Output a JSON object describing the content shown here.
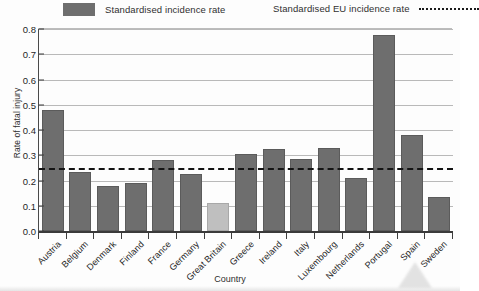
{
  "chart_data": {
    "type": "bar",
    "title": "",
    "xlabel": "Country",
    "ylabel": "Rate of fatal injury",
    "ylim": [
      0.0,
      0.8
    ],
    "ytick_labels": [
      "0.8",
      "0.7",
      "0.6",
      "0.5",
      "0.4",
      "0.3",
      "0.2",
      "0.1",
      "0.0"
    ],
    "ytick_values": [
      0.8,
      0.7,
      0.6,
      0.5,
      0.4,
      0.3,
      0.2,
      0.1,
      0.0
    ],
    "grid": "horizontal",
    "legend_position": "top",
    "categories": [
      "Austria",
      "Belgium",
      "Denmark",
      "Finland",
      "France",
      "Germany",
      "Great Britain",
      "Greece",
      "Ireland",
      "Italy",
      "Luxembourg",
      "Netherlands",
      "Portugal",
      "Spain",
      "Sweden"
    ],
    "values": [
      0.48,
      0.235,
      0.18,
      0.19,
      0.28,
      0.225,
      0.11,
      0.305,
      0.325,
      0.285,
      0.33,
      0.21,
      0.775,
      0.38,
      0.135
    ],
    "highlighted_category": "Great Britain",
    "reference_line": {
      "label": "Standardised EU incidence rate",
      "value": 0.25,
      "style": "dashed"
    },
    "series_label": "Standardised incidence rate",
    "colors": {
      "bar": "#6e6e6e",
      "bar_highlight": "#bfbfbf",
      "reference_line": "#141414",
      "gridline": "#b9b9b9",
      "axis": "#3a3a3a",
      "background": "#fdfdfd"
    }
  },
  "legend": {
    "bars_label": "Standardised incidence rate",
    "line_label": "Standardised EU incidence rate"
  },
  "axes": {
    "y_title": "Rate of fatal injury",
    "x_title": "Country"
  }
}
